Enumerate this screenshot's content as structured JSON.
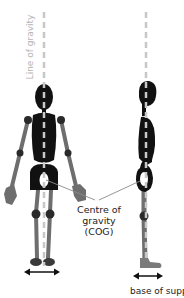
{
  "labels": {
    "line_of_gravity": "Line of gravity",
    "cog_line1": "Centre of",
    "cog_line2": "gravity",
    "cog_line3": "(COG)",
    "base_of_support": "base of support"
  },
  "figures": [
    {
      "name": "front-view",
      "description": "Stick figure viewed from the front"
    },
    {
      "name": "side-view",
      "description": "Stick figure viewed from the side"
    }
  ],
  "colors": {
    "body": "#111111",
    "limbs": "#6e6e6e",
    "gravity_line": "#c8c8c8",
    "cog_marker": "#ffffff",
    "pointer_line": "#8a8a8a",
    "text": "#222222"
  }
}
